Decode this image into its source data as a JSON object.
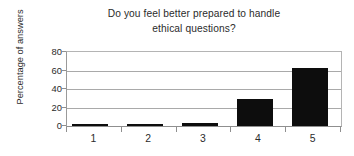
{
  "chart_data": {
    "type": "bar",
    "title": "Do you feel better prepared to handle ethical questions?",
    "title_lines": [
      "Do you feel better prepared to handle",
      "ethical questions?"
    ],
    "xlabel": "",
    "ylabel": "Percentage of answers",
    "categories": [
      "1",
      "2",
      "3",
      "4",
      "5"
    ],
    "values": [
      1,
      1,
      3,
      29,
      63
    ],
    "series": [
      {
        "name": "Percentage of answers",
        "values": [
          1,
          1,
          3,
          29,
          63
        ]
      }
    ],
    "ylim": [
      0,
      80
    ],
    "yticks": [
      0,
      20,
      40,
      60,
      80
    ],
    "ytick_labels": [
      "0",
      "20",
      "40",
      "60",
      "80"
    ],
    "grid": true,
    "grid_axis": "y",
    "legend": false,
    "legend_position": "none",
    "bar_color": "#0d0d0d",
    "grid_color": "#a9a9a9",
    "axis_color": "#8f8f8f",
    "text_color": "#2b2b2b",
    "background_color": "#ffffff"
  }
}
